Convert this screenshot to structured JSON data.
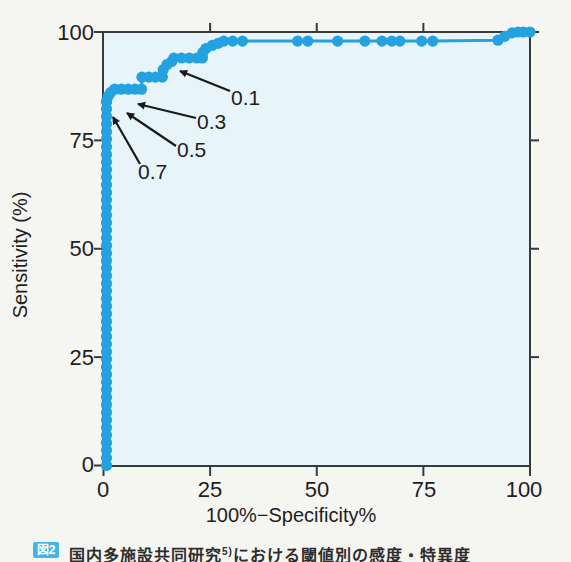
{
  "chart_data": {
    "type": "line",
    "subtype": "roc-curve-with-markers",
    "title": "",
    "xlabel": "100%−Specificity%",
    "ylabel": "Sensitivity (%)",
    "xlim": [
      0,
      100
    ],
    "ylim": [
      0,
      100
    ],
    "grid": false,
    "legend": "none",
    "x_ticks": [
      0,
      25,
      50,
      75,
      100
    ],
    "y_ticks": [
      0,
      25,
      50,
      75,
      100
    ],
    "x_tick_labels": [
      "0",
      "25",
      "50",
      "75",
      "100"
    ],
    "y_tick_labels": [
      "0",
      "25",
      "50",
      "75",
      "100"
    ],
    "curve_color": "#24a2e0",
    "plot_bg_color": "#e7f4f9",
    "frame_color": "#3a3a3a",
    "annotation_color": "#1a1a1a",
    "vertical_run": {
      "x": 0.7,
      "y_from": 0,
      "y_to": 84,
      "step": 1.75
    },
    "series": [
      {
        "name": "ROC curve",
        "points": [
          [
            0.7,
            84
          ],
          [
            1.1,
            85.2
          ],
          [
            1.7,
            86.1
          ],
          [
            2.6,
            86.8
          ],
          [
            4.2,
            86.8
          ],
          [
            5.8,
            86.8
          ],
          [
            7.4,
            86.8
          ],
          [
            8.9,
            86.8
          ],
          [
            9.0,
            89.6
          ],
          [
            10.6,
            89.6
          ],
          [
            12.2,
            89.6
          ],
          [
            13.8,
            89.6
          ],
          [
            14.0,
            91.3
          ],
          [
            14.9,
            92.5
          ],
          [
            16.0,
            93.2
          ],
          [
            16.5,
            94
          ],
          [
            18.3,
            94
          ],
          [
            20.1,
            94
          ],
          [
            21.9,
            94
          ],
          [
            23.2,
            94
          ],
          [
            23.3,
            95.3
          ],
          [
            24.0,
            96.2
          ],
          [
            25.5,
            96.9
          ],
          [
            26.9,
            97.4
          ],
          [
            28.2,
            97.9
          ],
          [
            30.3,
            97.9
          ],
          [
            32.6,
            97.9
          ],
          [
            45.5,
            97.9
          ],
          [
            47.9,
            97.9
          ],
          [
            54.9,
            97.9
          ],
          [
            61.3,
            97.9
          ],
          [
            65.3,
            97.9
          ],
          [
            67.6,
            97.9
          ],
          [
            69.5,
            97.9
          ],
          [
            74.6,
            97.9
          ],
          [
            77.2,
            97.9
          ],
          [
            92.5,
            98.1
          ],
          [
            94.1,
            99.0
          ],
          [
            95.8,
            99.8
          ],
          [
            97.2,
            100
          ],
          [
            98.4,
            100
          ],
          [
            100,
            100
          ]
        ]
      }
    ],
    "annotations": [
      {
        "label": "0.1",
        "label_x": 231,
        "label_y": 105,
        "tail_x": 230,
        "tail_y": 91,
        "tip_x": 180,
        "tip_y": 71
      },
      {
        "label": "0.3",
        "label_x": 197,
        "label_y": 129,
        "tail_x": 196,
        "tail_y": 118,
        "tip_x": 138,
        "tip_y": 104
      },
      {
        "label": "0.5",
        "label_x": 177,
        "label_y": 157,
        "tail_x": 176,
        "tail_y": 146,
        "tip_x": 127,
        "tip_y": 113
      },
      {
        "label": "0.7",
        "label_x": 138,
        "label_y": 179,
        "tail_x": 140,
        "tail_y": 164,
        "tip_x": 113,
        "tip_y": 117
      }
    ]
  },
  "caption": {
    "figure_badge": "図2",
    "text_partial": "国内多施設共同研究",
    "text_ref": "5)",
    "text_rest": "における閾値別の感度・特異度"
  }
}
